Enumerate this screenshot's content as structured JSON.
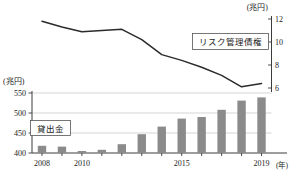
{
  "chart_data": {
    "type": "bar",
    "title": "",
    "subtitle": "",
    "xlabel": "(年)",
    "ylabel": "(兆円)",
    "y2label": "(兆円)",
    "grid": true,
    "legend_position": "inside",
    "categories": [
      "2008",
      "2009",
      "2010",
      "2011",
      "2012",
      "2013",
      "2014",
      "2015",
      "2016",
      "2017",
      "2018",
      "2019"
    ],
    "x_tick_labels": [
      "2008",
      "2010",
      "2015",
      "2019"
    ],
    "x_tick_years": [
      2008,
      2010,
      2015,
      2019
    ],
    "ylim": [
      400,
      550
    ],
    "y_ticks": [
      400,
      450,
      500,
      550
    ],
    "y2lim": [
      6,
      12
    ],
    "y2_ticks": [
      6,
      8,
      10,
      12
    ],
    "series": [
      {
        "name": "貸出金",
        "type": "bar",
        "axis": "left",
        "unit": "兆円",
        "color": "#8b8b8b",
        "values": [
          418,
          416,
          405,
          408,
          422,
          447,
          466,
          486,
          490,
          508,
          531,
          539
        ]
      },
      {
        "name": "リスク管理債権",
        "type": "line",
        "axis": "right",
        "unit": "兆円",
        "color": "#2b2b2b",
        "values": [
          11.8,
          11.3,
          10.9,
          11.0,
          11.1,
          10.2,
          8.9,
          8.4,
          7.8,
          7.1,
          6.1,
          6.4
        ]
      }
    ],
    "annotations": [
      {
        "name": "risk-managed-claims-legend",
        "text": "リスク管理債権"
      },
      {
        "name": "loans-legend",
        "text": "貸出金"
      }
    ]
  },
  "axes": {
    "left_unit": "(兆円)",
    "right_unit": "(兆円)",
    "x_unit": "(年)",
    "left_ticks": [
      "550",
      "500",
      "450",
      "400"
    ],
    "right_ticks": [
      "12",
      "10",
      "8",
      "6"
    ],
    "x_labels": [
      "2008",
      "2010",
      "2015",
      "2019"
    ]
  },
  "legend": {
    "line_series_label": "リスク管理債権",
    "bar_series_label": "貸出金"
  },
  "colors": {
    "bar": "#8b8b8b",
    "line": "#2b2b2b",
    "grid": "#b9b9b9",
    "axis": "#3c3c3c",
    "text": "#1d1d1d",
    "background": "#ffffff"
  }
}
